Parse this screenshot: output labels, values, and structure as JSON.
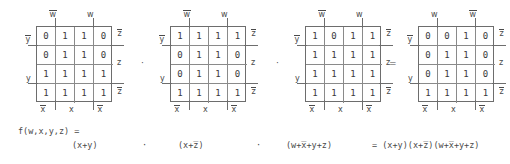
{
  "figure": {
    "equation": {
      "function_label": "f(w,x,y,z) =",
      "term1": "(x+y)",
      "dot1": "·",
      "term2": "(x+z̅)",
      "dot2": "·",
      "term3": "(w+x̅+y+z)",
      "result": "= (x+y)(x+z̅)(w+x̅+y+z)"
    },
    "operators": [
      {
        "symbol": "·"
      },
      {
        "symbol": "·"
      },
      {
        "symbol": "="
      }
    ],
    "kmaps": [
      {
        "name": "kmap-1",
        "top_labels": [
          "w",
          "w"
        ],
        "top_overbar": [
          true,
          false
        ],
        "bottom_labels": [
          "x",
          "x",
          "x"
        ],
        "bottom_overbar": [
          true,
          false,
          true
        ],
        "left_labels": [
          "y",
          "y"
        ],
        "left_overbar": [
          true,
          false
        ],
        "right_labels": [
          "z",
          "z",
          "z"
        ],
        "right_overbar": [
          true,
          false,
          true
        ],
        "cells": [
          [
            "0",
            "1",
            "1",
            "0"
          ],
          [
            "0",
            "1",
            "1",
            "0"
          ],
          [
            "1",
            "1",
            "1",
            "1"
          ],
          [
            "1",
            "1",
            "1",
            "1"
          ]
        ]
      },
      {
        "name": "kmap-2",
        "top_labels": [
          "w",
          "w"
        ],
        "top_overbar": [
          true,
          false
        ],
        "bottom_labels": [
          "x",
          "x",
          "x"
        ],
        "bottom_overbar": [
          true,
          false,
          true
        ],
        "left_labels": [
          "y",
          "y"
        ],
        "left_overbar": [
          true,
          false
        ],
        "right_labels": [
          "z",
          "z",
          "z"
        ],
        "right_overbar": [
          true,
          false,
          true
        ],
        "cells": [
          [
            "1",
            "1",
            "1",
            "1"
          ],
          [
            "0",
            "1",
            "1",
            "0"
          ],
          [
            "0",
            "1",
            "1",
            "0"
          ],
          [
            "1",
            "1",
            "1",
            "1"
          ]
        ]
      },
      {
        "name": "kmap-3",
        "top_labels": [
          "w",
          "w"
        ],
        "top_overbar": [
          true,
          false
        ],
        "bottom_labels": [
          "x",
          "x",
          "x"
        ],
        "bottom_overbar": [
          true,
          false,
          true
        ],
        "left_labels": [
          "y",
          "y"
        ],
        "left_overbar": [
          true,
          false
        ],
        "right_labels": [
          "z",
          "z",
          "z"
        ],
        "right_overbar": [
          true,
          false,
          true
        ],
        "cells": [
          [
            "1",
            "0",
            "1",
            "1"
          ],
          [
            "1",
            "1",
            "1",
            "1"
          ],
          [
            "1",
            "1",
            "1",
            "1"
          ],
          [
            "1",
            "1",
            "1",
            "1"
          ]
        ]
      },
      {
        "name": "kmap-4",
        "top_labels": [
          "w",
          "w"
        ],
        "top_overbar": [
          false,
          true
        ],
        "bottom_labels": [
          "x",
          "x",
          "x"
        ],
        "bottom_overbar": [
          true,
          false,
          true
        ],
        "left_labels": [
          "y",
          "y"
        ],
        "left_overbar": [
          true,
          false
        ],
        "right_labels": [
          "z",
          "z",
          "z"
        ],
        "right_overbar": [
          true,
          false,
          true
        ],
        "cells": [
          [
            "0",
            "0",
            "1",
            "0"
          ],
          [
            "0",
            "1",
            "1",
            "0"
          ],
          [
            "0",
            "1",
            "1",
            "0"
          ],
          [
            "1",
            "1",
            "1",
            "1"
          ]
        ]
      }
    ]
  }
}
